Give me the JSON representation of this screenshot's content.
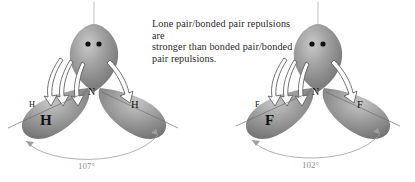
{
  "caption": {
    "line1": "Lone pair/bonded pair repulsions are",
    "line2": "stronger than bonded pair/bonded",
    "line3": "pair repulsions."
  },
  "molecules": [
    {
      "id": "ammonia",
      "center_atom": "N",
      "lone_pair_dots": 2,
      "bond_angle": "107°",
      "labels": {
        "left_small": "H",
        "left_large": "H",
        "right": "H"
      }
    },
    {
      "id": "nitrogen-trifluoride",
      "center_atom": "N",
      "lone_pair_dots": 2,
      "bond_angle": "102°",
      "labels": {
        "left_small": "F",
        "left_large": "F",
        "right": "F"
      }
    }
  ],
  "colors": {
    "background": "#ffffff",
    "lobe_dark": "#7b7b7b",
    "lobe_mid": "#9a9a9a",
    "lobe_light": "#c3c3c3",
    "dot": "#111111",
    "arrow_outline": "#5a5a5a",
    "arrow_fill": "#ffffff",
    "axis_line": "#b4b4b4",
    "angle_arc": "#9e9e9e",
    "bond_line": "#6e6e6e",
    "text": "#2a2a2a"
  }
}
